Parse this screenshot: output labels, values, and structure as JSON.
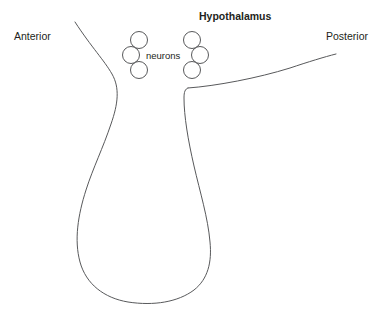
{
  "figure": {
    "background_color": "#ffffff",
    "stroke_color": "#58595b",
    "text_color": "#231f20"
  },
  "labels": {
    "anterior": "Anterior",
    "posterior": "Posterior",
    "hypothalamus": "Hypothalamus",
    "neurons": "neurons"
  },
  "neurons": {
    "count": 6,
    "radius": 8.5,
    "left_cluster": [
      {
        "cx": 139,
        "cy": 40
      },
      {
        "cx": 131,
        "cy": 55
      },
      {
        "cx": 139,
        "cy": 70
      }
    ],
    "right_cluster": [
      {
        "cx": 192,
        "cy": 40
      },
      {
        "cx": 200,
        "cy": 55
      },
      {
        "cx": 192,
        "cy": 70
      }
    ]
  },
  "outline": {
    "left_branch": "M 75 22 C 92 48 104 60 112 74 C 120 88 118 104 111 124 C 103 148 93 168 86 190 C 78 215 74 240 80 262 C 86 284 104 298 128 302 C 154 306 178 302 194 290 C 208 279 212 262 210 242 C 208 218 200 192 194 166 C 188 140 184 116 184 98 C 184 92 185 89 188 88",
    "right_branch": "M 188 88 C 216 86 258 78 290 68 C 308 62 324 57 336 54"
  }
}
